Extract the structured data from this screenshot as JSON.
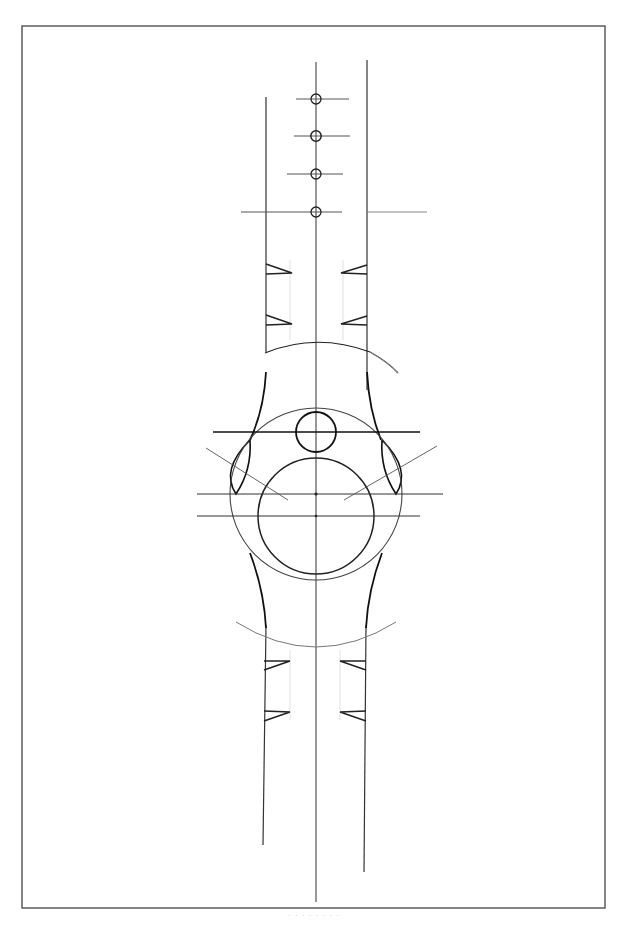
{
  "drawing": {
    "subject": "Watch construction line drawing",
    "caption": "· · · · · · · ·",
    "colors": {
      "paper": "#ffffff",
      "ink_dark": "#1e1e1e",
      "ink_mid": "#3a3a3a",
      "ink_light": "#9a9a9a",
      "frame": "#444444"
    },
    "frame": {
      "x": 22,
      "y": 26,
      "width": 583,
      "height": 882
    },
    "center_axis_x": 316,
    "strap": {
      "left_x": 266,
      "right_x": 367
    },
    "holes": [
      {
        "cx": 316,
        "cy": 99
      },
      {
        "cx": 316,
        "cy": 136
      },
      {
        "cx": 316,
        "cy": 174
      },
      {
        "cx": 316,
        "cy": 213
      }
    ],
    "case": {
      "outer_circle": {
        "cx": 316,
        "cy": 494,
        "r": 86
      },
      "dial_circle": {
        "cx": 316,
        "cy": 516,
        "r": 58
      },
      "crown_circle": {
        "cx": 316,
        "cy": 432,
        "r": 20
      },
      "guide_lines_y": [
        432,
        494,
        516
      ]
    }
  }
}
